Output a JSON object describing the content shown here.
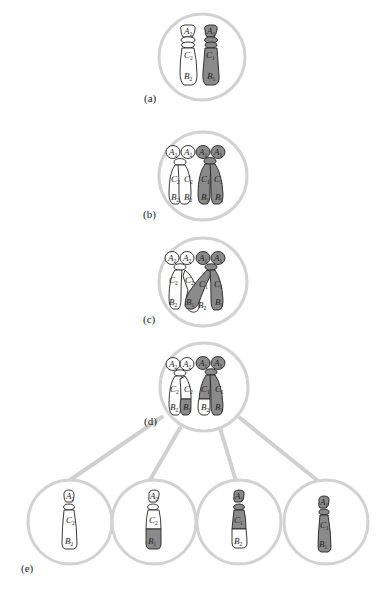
{
  "colors": {
    "circle_stroke": "#d2d2d2",
    "connector": "#d0d0d0",
    "chromosome_light": "#ffffff",
    "chromosome_dark": "#8a8a8a",
    "outline": "#222222"
  },
  "panels": {
    "a": {
      "label": "(a)"
    },
    "b": {
      "label": "(b)"
    },
    "c": {
      "label": "(c)"
    },
    "d": {
      "label": "(d)"
    },
    "e": {
      "label": "(e)"
    }
  },
  "diagram": {
    "type": "chromosome crossing-over illustration",
    "stages": [
      {
        "id": "a",
        "description": "Two homologous chromosomes",
        "chromosomes": [
          {
            "shade": "light",
            "genes": [
              "A2",
              "C2",
              "B2"
            ]
          },
          {
            "shade": "dark",
            "genes": [
              "A1",
              "C1",
              "B1"
            ]
          }
        ]
      },
      {
        "id": "b",
        "description": "Replicated homologues, each with two sister chromatids",
        "chromosomes": [
          {
            "shade": "light",
            "chromatids": [
              [
                "A2",
                "C2",
                "B2"
              ],
              [
                "A2",
                "C2",
                "B2"
              ]
            ]
          },
          {
            "shade": "dark",
            "chromatids": [
              [
                "A1",
                "C1",
                "B1"
              ],
              [
                "A1",
                "C1",
                "B1"
              ]
            ]
          }
        ]
      },
      {
        "id": "c",
        "description": "Non-sister chromatids cross over",
        "chromosomes": [
          {
            "shade": "light",
            "chromatids": [
              [
                "A2",
                "C2",
                "B2"
              ],
              [
                "A2",
                "C2",
                "B2"
              ]
            ]
          },
          {
            "shade": "dark",
            "chromatids": [
              [
                "A1",
                "C1",
                "B1"
              ],
              [
                "A1",
                "C1",
                "B1"
              ]
            ]
          }
        ]
      },
      {
        "id": "d",
        "description": "Exchange of segments between non-sister chromatids",
        "chromatids": [
          {
            "genes": [
              "A2",
              "C2",
              "B2"
            ],
            "shading": "all light"
          },
          {
            "genes": [
              "A2",
              "C2",
              "B1"
            ],
            "shading": "B region dark"
          },
          {
            "genes": [
              "A1",
              "C1",
              "B2"
            ],
            "shading": "B region light"
          },
          {
            "genes": [
              "A1",
              "C1",
              "B1"
            ],
            "shading": "all dark"
          }
        ]
      },
      {
        "id": "e",
        "description": "Four resulting chromatids",
        "chromatids": [
          {
            "genes": [
              "A2",
              "C2",
              "B2"
            ],
            "shading": "all light"
          },
          {
            "genes": [
              "A2",
              "C2",
              "B1"
            ],
            "shading": "B region dark"
          },
          {
            "genes": [
              "A1",
              "C1",
              "B2"
            ],
            "shading": "B region light"
          },
          {
            "genes": [
              "A1",
              "C1",
              "B1"
            ],
            "shading": "all dark"
          }
        ]
      }
    ]
  },
  "text": {
    "A1": "A",
    "A2": "A",
    "B1": "B",
    "B2": "B",
    "C1": "C",
    "C2": "C",
    "s1": "1",
    "s2": "2"
  }
}
